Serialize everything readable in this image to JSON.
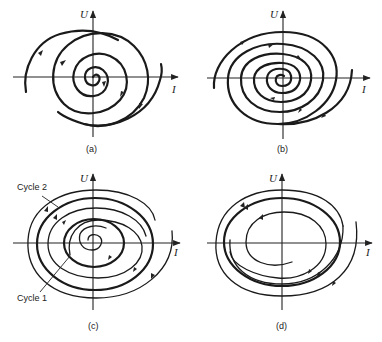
{
  "figure": {
    "panels": [
      {
        "id": "a",
        "caption": "(a)",
        "y_axis_label": "U",
        "x_axis_label": "I",
        "description": "Unstable focus: trajectory spirals outward from origin"
      },
      {
        "id": "b",
        "caption": "(b)",
        "y_axis_label": "U",
        "x_axis_label": "I",
        "description": "Stable focus: trajectory spirals inward toward origin"
      },
      {
        "id": "c",
        "caption": "(c)",
        "y_axis_label": "U",
        "x_axis_label": "I",
        "description": "Two limit cycles",
        "annotations": [
          "Cycle 2",
          "Cycle 1"
        ]
      },
      {
        "id": "d",
        "caption": "(d)",
        "y_axis_label": "U",
        "x_axis_label": "I",
        "description": "Stable limit cycle approached from inside and outside"
      }
    ]
  }
}
